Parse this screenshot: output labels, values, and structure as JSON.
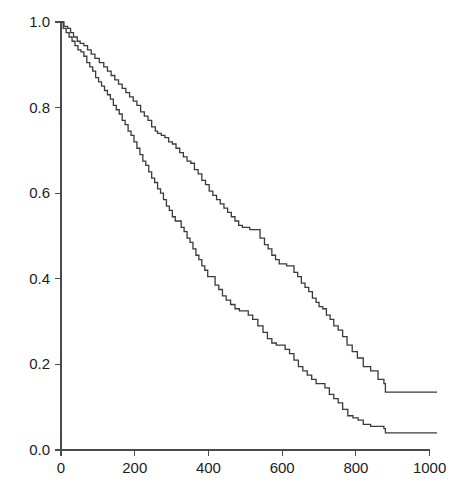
{
  "chart_data": {
    "type": "line",
    "title": "",
    "subtitle": "",
    "xlabel": "",
    "ylabel": "",
    "xlim": [
      0,
      1020
    ],
    "ylim": [
      0.0,
      1.0
    ],
    "grid": false,
    "legend": "none",
    "annotations": [],
    "step_style": "post",
    "x_ticks": [
      0,
      200,
      400,
      600,
      800,
      1000
    ],
    "x_tick_labels": [
      "0",
      "200",
      "400",
      "600",
      "800",
      "1000"
    ],
    "y_ticks": [
      0.0,
      0.2,
      0.4,
      0.6,
      0.8,
      1.0
    ],
    "y_tick_labels": [
      "0.0",
      "0.2",
      "0.4",
      "0.6",
      "0.8",
      "1.0"
    ],
    "series": [
      {
        "name": "upper-curve",
        "color": "#3a3a3a",
        "x": [
          0,
          8,
          18,
          26,
          34,
          44,
          52,
          62,
          72,
          82,
          92,
          104,
          116,
          126,
          136,
          146,
          156,
          166,
          176,
          186,
          196,
          206,
          216,
          226,
          236,
          246,
          256,
          262,
          272,
          282,
          292,
          302,
          312,
          322,
          332,
          342,
          352,
          362,
          372,
          382,
          392,
          402,
          412,
          422,
          432,
          442,
          452,
          462,
          472,
          482,
          492,
          502,
          512,
          528,
          540,
          552,
          562,
          572,
          582,
          592,
          602,
          612,
          622,
          632,
          642,
          652,
          662,
          672,
          682,
          692,
          700,
          710,
          720,
          730,
          740,
          752,
          764,
          776,
          790,
          804,
          820,
          840,
          860,
          876,
          880,
          1020
        ],
        "y": [
          1.0,
          0.99,
          0.985,
          0.975,
          0.965,
          0.955,
          0.95,
          0.945,
          0.935,
          0.925,
          0.915,
          0.905,
          0.895,
          0.885,
          0.875,
          0.865,
          0.855,
          0.845,
          0.835,
          0.825,
          0.815,
          0.805,
          0.79,
          0.78,
          0.77,
          0.755,
          0.745,
          0.74,
          0.735,
          0.73,
          0.72,
          0.715,
          0.705,
          0.695,
          0.685,
          0.675,
          0.67,
          0.655,
          0.645,
          0.63,
          0.62,
          0.605,
          0.595,
          0.585,
          0.575,
          0.565,
          0.555,
          0.545,
          0.535,
          0.525,
          0.52,
          0.52,
          0.515,
          0.515,
          0.495,
          0.48,
          0.47,
          0.455,
          0.445,
          0.435,
          0.435,
          0.43,
          0.43,
          0.415,
          0.405,
          0.39,
          0.38,
          0.37,
          0.355,
          0.345,
          0.335,
          0.33,
          0.315,
          0.305,
          0.29,
          0.28,
          0.265,
          0.245,
          0.23,
          0.215,
          0.195,
          0.185,
          0.165,
          0.155,
          0.135,
          0.135
        ]
      },
      {
        "name": "lower-curve",
        "color": "#3a3a3a",
        "x": [
          0,
          6,
          14,
          22,
          30,
          38,
          46,
          54,
          62,
          70,
          78,
          86,
          94,
          102,
          110,
          118,
          126,
          134,
          142,
          150,
          158,
          166,
          174,
          182,
          190,
          198,
          206,
          214,
          222,
          230,
          238,
          246,
          254,
          262,
          270,
          278,
          286,
          294,
          302,
          310,
          318,
          326,
          334,
          342,
          350,
          358,
          366,
          374,
          382,
          390,
          398,
          406,
          418,
          428,
          438,
          448,
          460,
          472,
          484,
          496,
          508,
          520,
          534,
          548,
          560,
          572,
          584,
          596,
          608,
          620,
          632,
          644,
          656,
          668,
          680,
          692,
          704,
          716,
          728,
          740,
          752,
          764,
          778,
          792,
          806,
          820,
          840,
          860,
          876,
          880,
          1020
        ],
        "y": [
          1.0,
          0.985,
          0.975,
          0.965,
          0.955,
          0.945,
          0.935,
          0.93,
          0.92,
          0.905,
          0.895,
          0.885,
          0.87,
          0.86,
          0.85,
          0.84,
          0.83,
          0.82,
          0.805,
          0.795,
          0.785,
          0.77,
          0.76,
          0.745,
          0.735,
          0.72,
          0.705,
          0.69,
          0.675,
          0.665,
          0.65,
          0.635,
          0.625,
          0.61,
          0.6,
          0.585,
          0.57,
          0.56,
          0.545,
          0.535,
          0.535,
          0.52,
          0.51,
          0.495,
          0.485,
          0.47,
          0.455,
          0.445,
          0.43,
          0.42,
          0.405,
          0.405,
          0.385,
          0.375,
          0.36,
          0.35,
          0.34,
          0.33,
          0.325,
          0.325,
          0.315,
          0.305,
          0.29,
          0.275,
          0.26,
          0.25,
          0.245,
          0.245,
          0.235,
          0.225,
          0.21,
          0.195,
          0.185,
          0.175,
          0.165,
          0.155,
          0.155,
          0.145,
          0.13,
          0.12,
          0.11,
          0.095,
          0.08,
          0.075,
          0.07,
          0.06,
          0.055,
          0.055,
          0.05,
          0.04,
          0.04
        ]
      }
    ]
  },
  "geometry": {
    "plot_left": 61,
    "plot_right": 437,
    "plot_top": 22,
    "plot_bottom": 450,
    "tick_size": 6
  },
  "colors": {
    "background": "#ffffff",
    "axis": "#4a4a4a",
    "curve": "#3a3a3a",
    "text": "#1c1c1c"
  }
}
